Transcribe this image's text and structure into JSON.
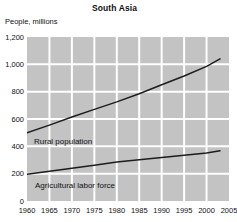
{
  "chart": {
    "title": "South Asia",
    "y_axis_title": "People, millions"
  },
  "chart_data": {
    "type": "line",
    "title": "South Asia",
    "ylabel": "People, millions",
    "xlabel": "",
    "xlim": [
      1960,
      2005
    ],
    "ylim": [
      0,
      1200
    ],
    "x_ticks": [
      1960,
      1965,
      1970,
      1975,
      1980,
      1985,
      1990,
      1995,
      2000,
      2005
    ],
    "x_tick_labels": [
      "1960",
      "1965",
      "1970",
      "1975",
      "1980",
      "1985",
      "1990",
      "1995",
      "2000",
      "2005"
    ],
    "y_ticks": [
      0,
      200,
      400,
      600,
      800,
      1000,
      1200
    ],
    "y_tick_labels": [
      "0",
      "200",
      "400",
      "600",
      "800",
      "1,000",
      "1,200"
    ],
    "grid": true,
    "legend_position": "inline-labels",
    "plot_background_color": "#c3c3c3",
    "grid_color": "#ffffff",
    "line_color": "#1d1d1d",
    "series": [
      {
        "name": "Rural population",
        "x": [
          1960,
          1965,
          1970,
          1975,
          1980,
          1985,
          1990,
          1995,
          2000,
          2003
        ],
        "values": [
          500,
          555,
          615,
          670,
          725,
          785,
          850,
          915,
          985,
          1040
        ]
      },
      {
        "name": "Agricultural labor force",
        "x": [
          1960,
          1965,
          1970,
          1975,
          1980,
          1985,
          1990,
          1995,
          2000,
          2003
        ],
        "values": [
          195,
          218,
          240,
          262,
          285,
          302,
          318,
          335,
          352,
          368
        ]
      }
    ]
  }
}
